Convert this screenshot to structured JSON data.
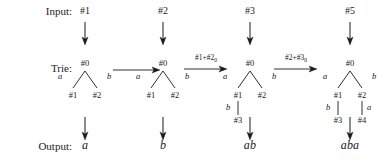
{
  "figure": {
    "width": 386,
    "height": 163,
    "background": "#ffffff",
    "ink": "#1a1a1a"
  },
  "row_labels": {
    "input": "Input:",
    "trie": "Trie:",
    "output": "Output:"
  },
  "columns": [
    {
      "id": "col-1",
      "input": "#1",
      "output": "a",
      "trie": {
        "root": "#0",
        "left_edge_letter": "a",
        "right_edge_letter": "b",
        "left_child": "#1",
        "right_child": "#2",
        "left_grandchild_letter": "",
        "left_grandchild": "",
        "right_grandchild_letter": "",
        "right_grandchild": ""
      }
    },
    {
      "id": "col-2",
      "input": "#2",
      "output": "b",
      "trie": {
        "root": "#0",
        "left_edge_letter": "a",
        "right_edge_letter": "b",
        "left_child": "#1",
        "right_child": "#2",
        "left_grandchild_letter": "",
        "left_grandchild": "",
        "right_grandchild_letter": "",
        "right_grandchild": ""
      }
    },
    {
      "id": "col-3",
      "input": "#3",
      "output": "ab",
      "trie": {
        "root": "#0",
        "left_edge_letter": "a",
        "right_edge_letter": "b",
        "left_child": "#1",
        "right_child": "#2",
        "left_grandchild_letter": "b",
        "left_grandchild": "#3",
        "right_grandchild_letter": "",
        "right_grandchild": ""
      }
    },
    {
      "id": "col-4",
      "input": "#5",
      "output": "aba",
      "trie": {
        "root": "#0",
        "left_edge_letter": "a",
        "right_edge_letter": "b",
        "left_child": "#1",
        "right_child": "#2",
        "left_grandchild_letter": "b",
        "left_grandchild": "#3",
        "right_grandchild_letter": "a",
        "right_grandchild": "#4"
      }
    }
  ],
  "transitions": [
    {
      "id": "t1",
      "label_main": "",
      "label_sub": ""
    },
    {
      "id": "t2",
      "label_main": "#1+#2",
      "label_sub": "0"
    },
    {
      "id": "t3",
      "label_main": "#2+#3",
      "label_sub": "0"
    }
  ]
}
